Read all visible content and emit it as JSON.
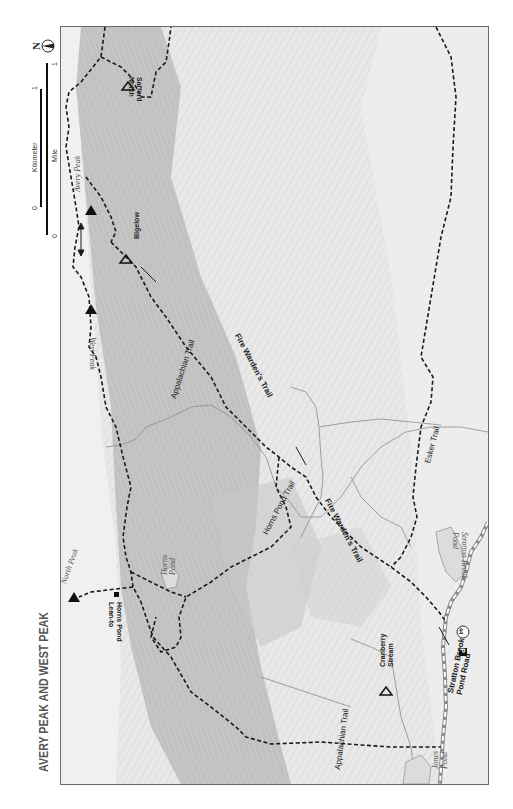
{
  "map": {
    "title": "AVERY PEAK AND WEST PEAK",
    "orientation": "rotated 90° (north points left)",
    "colors": {
      "frame": "#6a6a6a",
      "ridge_shade": "#b9b9b9",
      "terrain": "#e6e6e6",
      "trail": "#1a1a1a",
      "stream": "#8c8c8c",
      "water_label": "#666666"
    }
  },
  "scale_bar": {
    "kilometer_label": "Kilometer",
    "mile_label": "Mile",
    "km_start": "0",
    "km_end": "1",
    "mile_start": "0",
    "mile_end": "1"
  },
  "north_arrow": {
    "label": "N",
    "icon": "north-arrow-icon"
  },
  "peaks": [
    {
      "name": "Avery Peak",
      "icon": "summit-triangle-icon"
    },
    {
      "name": "West Peak",
      "icon": "summit-triangle-icon"
    },
    {
      "name": "North Peak",
      "icon": "summit-triangle-icon"
    }
  ],
  "campsites": [
    {
      "name": "Safford Notch",
      "icon": "campsite-tent-icon"
    },
    {
      "name": "Bigelow",
      "icon": "campsite-tent-icon"
    },
    {
      "name": "Cranberry Stream",
      "icon": "campsite-tent-icon"
    }
  ],
  "shelters": [
    {
      "name": "Horns Pond Lean-to",
      "icon": "shelter-square-icon"
    }
  ],
  "trails": [
    {
      "name": "Appalachian Trail"
    },
    {
      "name": "Appalachian Trail (south)"
    },
    {
      "name": "Fire Warden's Trail"
    },
    {
      "name": "Fire Warden's Trail (lower)"
    },
    {
      "name": "Horns Pond Trail"
    },
    {
      "name": "Esker Trail"
    }
  ],
  "water": [
    {
      "name": "Horns Pond"
    },
    {
      "name": "Stratton Brook Pond"
    },
    {
      "name": "Jones Pond"
    }
  ],
  "roads": [
    {
      "name": "Stratton Brook Pond Road",
      "line1": "Stratton Brook",
      "line2": "Pond Road"
    }
  ],
  "trailhead": {
    "parking_label": "P",
    "marker_number": "44"
  },
  "labels": {
    "avery_peak": "Avery Peak",
    "west_peak": "West Peak",
    "north_peak": "North Peak",
    "safford_1": "Safford",
    "safford_2": "Notch",
    "bigelow": "Bigelow",
    "cranberry_1": "Cranberry",
    "cranberry_2": "Stream",
    "horns_leanto_1": "Horns Pond",
    "horns_leanto_2": "Lean-to",
    "horns_pond_1": "Horns",
    "horns_pond_2": "Pond",
    "stratton_pond_1": "Stratton Brook",
    "stratton_pond_2": "Pond",
    "jones_pond_1": "Jones",
    "jones_pond_2": "Pond",
    "at_north": "Appalachian Trail",
    "at_south": "Appalachian Trail",
    "fire_warden_1": "Fire Warden's Trail",
    "fire_warden_2": "Fire Warden's Trail",
    "horns_pond_trail": "Horns Pond Trail",
    "esker_trail": "Esker Trail",
    "road_1": "Stratton Brook",
    "road_2": "Pond Road"
  }
}
